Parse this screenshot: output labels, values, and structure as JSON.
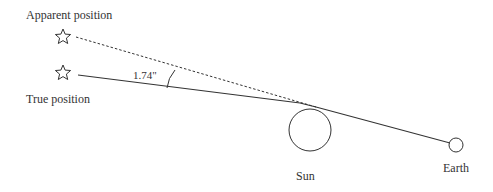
{
  "labels": {
    "apparent_position": "Apparent position",
    "true_position": "True position",
    "angle": "1.74\"",
    "sun": "Sun",
    "earth": "Earth"
  },
  "colors": {
    "stroke": "#333333",
    "background": "#ffffff"
  },
  "icons": {
    "apparent_star": "star-outline-icon",
    "true_star": "star-outline-icon"
  }
}
